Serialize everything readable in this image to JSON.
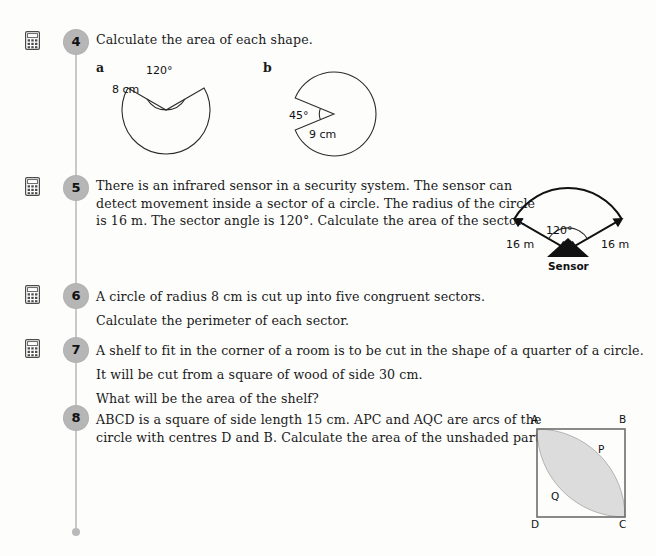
{
  "page": {
    "background": "#fdfdfc",
    "ink": "#1a1a1a",
    "spine_color": "#c9c9c9",
    "qnum_bubble_color": "#b6b6b6",
    "shade_color": "#dcdcdc"
  },
  "icons": {
    "calculator": "calculator-icon"
  },
  "questions": [
    {
      "number": "4",
      "has_calculator": true,
      "lines": [
        "Calculate the area of each shape."
      ],
      "parts": [
        {
          "label": "a",
          "shape": "circle-with-120-degree-sector-removed",
          "angle_label": "120°",
          "radius_label": "8 cm"
        },
        {
          "label": "b",
          "shape": "circle-with-45-degree-sector-removed",
          "angle_label": "45°",
          "radius_label": "9 cm"
        }
      ]
    },
    {
      "number": "5",
      "has_calculator": true,
      "lines": [
        "There is an infrared sensor in a security system. The sensor can",
        "detect movement inside a sector of a circle. The radius of the circle",
        "is 16 m. The sector angle is 120°. Calculate the area of the sector."
      ],
      "diagram": {
        "name": "infrared-sensor-sector-diagram",
        "angle_label": "120°",
        "left_radius_label": "16 m",
        "right_radius_label": "16 m",
        "sensor_label": "Sensor"
      }
    },
    {
      "number": "6",
      "has_calculator": true,
      "lines": [
        "A circle of radius 8 cm is cut up into five congruent sectors.",
        "Calculate the perimeter of each sector."
      ]
    },
    {
      "number": "7",
      "has_calculator": true,
      "lines": [
        "A shelf to fit in the corner of a room is to be cut in the shape of a quarter of a circle.",
        "It will be cut from a square of wood of side 30 cm.",
        "What will be the area of the shelf?"
      ]
    },
    {
      "number": "8",
      "has_calculator": false,
      "lines": [
        "ABCD is a square of side length 15 cm. APC and AQC are arcs of the",
        "circle with centres D and B. Calculate the area of the unshaded part."
      ],
      "diagram": {
        "name": "square-abcd-with-shaded-lens",
        "vertex_a": "A",
        "vertex_b": "B",
        "vertex_c": "C",
        "vertex_d": "D",
        "arc_point_p": "P",
        "arc_point_q": "Q"
      }
    }
  ]
}
